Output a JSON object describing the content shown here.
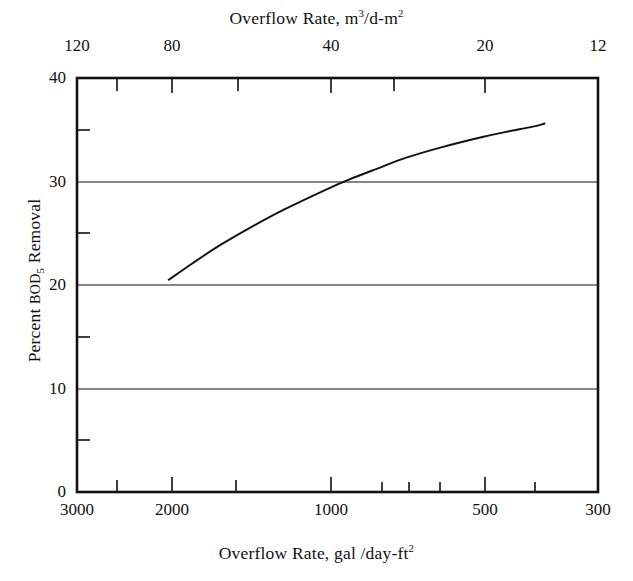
{
  "figure": {
    "background_color": "#ffffff",
    "line_color": "#111111"
  },
  "top_axis": {
    "title_text": "Overflow Rate,  m",
    "title_sup1": "3",
    "title_mid": "/d-m",
    "title_sup2": "2",
    "ticks": [
      {
        "label": "120",
        "x": 77
      },
      {
        "label": "80",
        "x": 172
      },
      {
        "label": "40",
        "x": 331
      },
      {
        "label": "20",
        "x": 485
      },
      {
        "label": "12",
        "x": 598
      }
    ]
  },
  "bottom_axis": {
    "title_text": "Overflow Rate,  gal /day-ft",
    "title_sup": "2",
    "ticks": [
      {
        "label": "3000",
        "x": 77
      },
      {
        "label": "2000",
        "x": 172
      },
      {
        "label": "1000",
        "x": 331
      },
      {
        "label": "500",
        "x": 485
      },
      {
        "label": "300",
        "x": 598
      }
    ]
  },
  "y_axis": {
    "title_prefix": "Percent ",
    "title_smallcaps": "BOD",
    "title_sub": "5",
    "title_suffix": " Removal",
    "ticks": [
      {
        "label": "40",
        "y": 78
      },
      {
        "label": "30",
        "y": 182
      },
      {
        "label": "20",
        "y": 285
      },
      {
        "label": "10",
        "y": 389
      },
      {
        "label": "0",
        "y": 492
      }
    ]
  },
  "chart_data": {
    "type": "line",
    "title": "",
    "xlabel": "Overflow Rate, gal/day-ft^2",
    "ylabel": "Percent BOD5 Removal",
    "x_scale": "log",
    "x_reversed": true,
    "xlim": [
      3000,
      300
    ],
    "ylim": [
      0,
      40
    ],
    "x_ticks": [
      3000,
      2000,
      1000,
      500,
      300
    ],
    "x_ticks_secondary": [
      120,
      80,
      40,
      20,
      12
    ],
    "secondary_x_label": "Overflow Rate, m^3/d-m^2",
    "y_ticks": [
      0,
      10,
      20,
      30,
      40
    ],
    "y_minor_ticks": [
      5,
      15,
      25,
      35
    ],
    "grid": "horizontal gridlines at 10, 20, 30",
    "legend": "none",
    "series": [
      {
        "name": "BOD5 removal vs overflow rate",
        "x": [
          2000,
          1800,
          1600,
          1400,
          1200,
          1000,
          900,
          800,
          700,
          600,
          500,
          450,
          400,
          380
        ],
        "y": [
          20.5,
          22.1,
          23.8,
          25.5,
          27.3,
          29.2,
          30.2,
          31.2,
          32.3,
          33.3,
          34.3,
          34.8,
          35.3,
          35.6
        ]
      }
    ]
  },
  "plot_box": {
    "left": 77,
    "right": 598,
    "top": 78,
    "bottom": 492
  }
}
